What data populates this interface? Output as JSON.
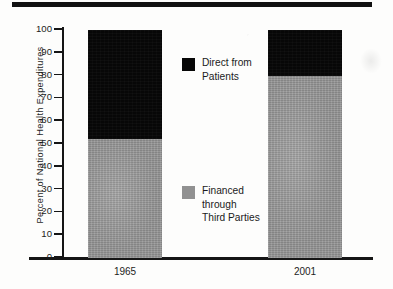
{
  "figure": {
    "background_color": "#fdfdfc",
    "top_rule_color": "#111111"
  },
  "chart_data": {
    "type": "bar",
    "subtype": "stacked-bar-100-percent",
    "title": "",
    "subtitle": "",
    "xlabel": "",
    "ylabel": "Percent of National Health Expenditures",
    "categories": [
      "1965",
      "2001"
    ],
    "series": [
      {
        "name": "Financed through Third Parties",
        "color": "#919191",
        "values": [
          52,
          80
        ]
      },
      {
        "name": "Direct from Patients",
        "color": "#070707",
        "values": [
          48,
          20
        ]
      }
    ],
    "stack_order_bottom_to_top": [
      "Financed through Third Parties",
      "Direct from Patients"
    ],
    "ylim": [
      0,
      100
    ],
    "ytick_values": [
      0,
      10,
      20,
      30,
      40,
      50,
      60,
      70,
      80,
      90,
      100
    ],
    "ytick_labels": [
      "0",
      "10",
      "20",
      "30",
      "40",
      "50",
      "60",
      "70",
      "80",
      "90",
      "100"
    ],
    "grid": false,
    "legend_position": "inside-center",
    "annotations": []
  },
  "axis": {
    "y_title": "Percent of National Health Expenditures",
    "ticks": [
      {
        "label": "100",
        "value": 100
      },
      {
        "label": "90",
        "value": 90
      },
      {
        "label": "80",
        "value": 80
      },
      {
        "label": "70",
        "value": 70
      },
      {
        "label": "60",
        "value": 60
      },
      {
        "label": "50",
        "value": 50
      },
      {
        "label": "40",
        "value": 40
      },
      {
        "label": "30",
        "value": 30
      },
      {
        "label": "20",
        "value": 20
      },
      {
        "label": "10",
        "value": 10
      },
      {
        "label": "0",
        "value": 0
      }
    ]
  },
  "categories": [
    {
      "label": "1965"
    },
    {
      "label": "2001"
    }
  ],
  "legend": {
    "items": [
      {
        "label_lines": [
          "Direct from",
          "Patients"
        ],
        "line1": "Direct from",
        "line2": "Patients",
        "line3": "",
        "swatch_color": "#070707",
        "swatch_name": "black-swatch"
      },
      {
        "label_lines": [
          "Financed",
          "through",
          "Third Parties"
        ],
        "line1": "Financed",
        "line2": "through",
        "line3": "Third Parties",
        "swatch_color": "#919191",
        "swatch_name": "gray-swatch"
      }
    ]
  }
}
